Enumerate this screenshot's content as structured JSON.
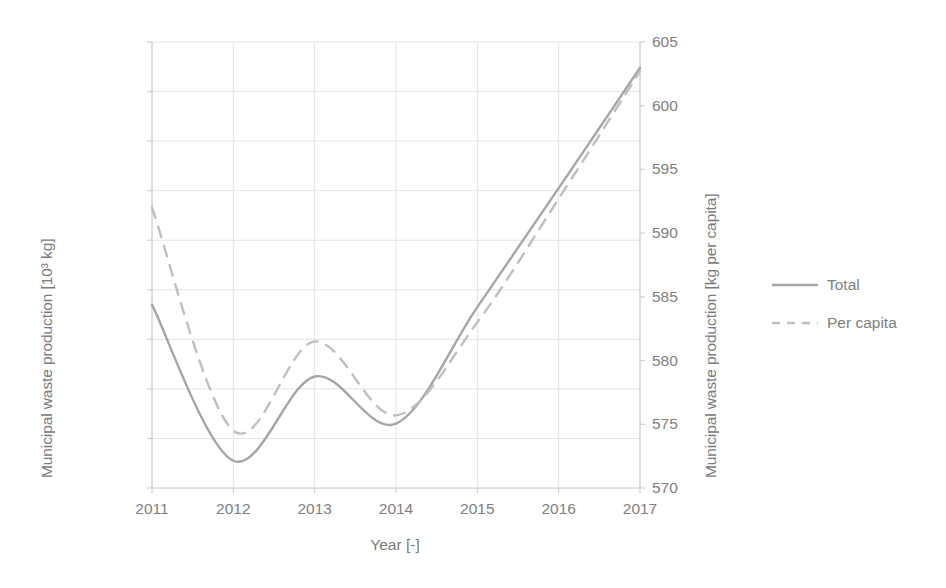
{
  "chart_data": {
    "type": "line",
    "title": "",
    "xlabel": "Year [-]",
    "ylabel": "Municipal waste production [10³ kg]",
    "y2label": "Municipal waste production [kg per capita]",
    "categories": [
      "2011",
      "2012",
      "2013",
      "2014",
      "2015",
      "2016",
      "2017"
    ],
    "x": [
      2011,
      2012,
      2013,
      2014,
      2015,
      2016,
      2017
    ],
    "xlim": [
      2011,
      2017
    ],
    "ylim": [
      119000,
      128000
    ],
    "y2lim": [
      570,
      605
    ],
    "ytick_step": 1000,
    "y2tick_step": 5,
    "grid": true,
    "legend_position": "right",
    "smoothing": "spline",
    "series": [
      {
        "name": "Total",
        "axis": "left",
        "style": "solid",
        "color": "#a6a6a6",
        "unit": "10^3 kg",
        "values": [
          122700,
          119550,
          121250,
          120300,
          122650,
          125050,
          127480
        ]
      },
      {
        "name": "Per capita",
        "axis": "right",
        "style": "dashed",
        "color": "#bfbfbf",
        "unit": "kg per capita",
        "values": [
          592.0,
          574.5,
          581.5,
          575.7,
          583.0,
          592.7,
          602.7
        ]
      }
    ],
    "ytick_labels": [
      "128 000",
      "127 000",
      "126 000",
      "125 000",
      "124 000",
      "123 000",
      "122 000",
      "121 000",
      "120 000",
      "119 000"
    ],
    "y2tick_labels": [
      "605",
      "600",
      "595",
      "590",
      "585",
      "580",
      "575",
      "570"
    ]
  },
  "legend": {
    "items": [
      {
        "label": "Total",
        "style": "solid"
      },
      {
        "label": "Per capita",
        "style": "dashed"
      }
    ]
  },
  "colors": {
    "total_line": "#a6a6a6",
    "per_capita_line": "#bfbfbf",
    "grid": "#e4e4e4",
    "axis": "#d0d0d0",
    "text": "#808080"
  }
}
